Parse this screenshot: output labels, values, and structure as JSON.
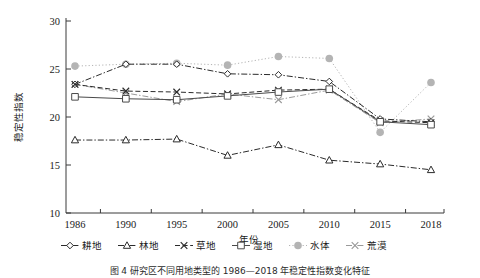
{
  "figure": {
    "caption": "图 4    研究区不同用地类型的 1986—2018 年稳定性指数变化特征",
    "background": "#ffffff"
  },
  "axes": {
    "y_label": "稳定性指数",
    "x_label": "年份",
    "y_ticks": [
      "10",
      "15",
      "20",
      "25",
      "30"
    ],
    "y_tick_values": [
      10,
      15,
      20,
      25,
      30
    ],
    "x_ticks": [
      "1986",
      "1990",
      "1995",
      "2000",
      "2005",
      "2010",
      "2015",
      "2018"
    ],
    "ylim": [
      10,
      30
    ],
    "grid": "off"
  },
  "legend": {
    "position": "bottom",
    "entries": [
      {
        "label": "耕地",
        "marker": "diamond",
        "line": "dashdot",
        "color": "#2b2b2b"
      },
      {
        "label": "林地",
        "marker": "triangle",
        "line": "dashdot",
        "color": "#2b2b2b"
      },
      {
        "label": "草地",
        "marker": "cross",
        "line": "dashed",
        "color": "#2b2b2b"
      },
      {
        "label": "湿地",
        "marker": "square",
        "line": "solid",
        "color": "#4a4a4a"
      },
      {
        "label": "水体",
        "marker": "circle",
        "line": "dotted",
        "color": "#b4b4b4"
      },
      {
        "label": "荒漠",
        "marker": "cross",
        "line": "dashdot",
        "color": "#9a9a9a"
      }
    ]
  },
  "chart_data": {
    "type": "line",
    "title": "",
    "xlabel": "年份",
    "ylabel": "稳定性指数",
    "ylim": [
      10,
      30
    ],
    "grid": false,
    "legend_position": "bottom",
    "categories": [
      "1986",
      "1990",
      "1995",
      "2000",
      "2005",
      "2010",
      "2015",
      "2018"
    ],
    "x": [
      1986,
      1990,
      1995,
      2000,
      2005,
      2010,
      2015,
      2018
    ],
    "series": [
      {
        "name": "耕地",
        "marker": "diamond",
        "values": [
          23.4,
          25.5,
          25.5,
          24.5,
          24.4,
          23.7,
          19.8,
          19.5
        ]
      },
      {
        "name": "林地",
        "marker": "triangle",
        "values": [
          17.6,
          17.6,
          17.7,
          16.0,
          17.1,
          15.5,
          15.1,
          14.5
        ]
      },
      {
        "name": "草地",
        "marker": "cross",
        "values": [
          23.4,
          22.7,
          22.6,
          22.4,
          22.8,
          22.9,
          19.6,
          19.4
        ]
      },
      {
        "name": "湿地",
        "marker": "square",
        "values": [
          22.1,
          21.9,
          21.8,
          22.2,
          22.6,
          22.9,
          19.5,
          19.2
        ]
      },
      {
        "name": "水体",
        "marker": "circle",
        "values": [
          25.3,
          25.5,
          25.6,
          25.4,
          26.3,
          26.1,
          18.4,
          23.6
        ]
      },
      {
        "name": "荒漠",
        "marker": "cross",
        "values": [
          23.4,
          22.5,
          21.6,
          22.4,
          21.8,
          22.8,
          19.4,
          19.8
        ]
      }
    ]
  }
}
